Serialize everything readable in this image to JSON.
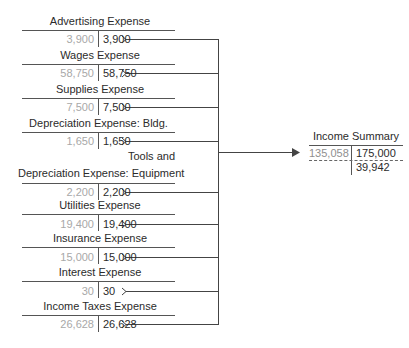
{
  "accounts": [
    {
      "title": "Advertising Expense",
      "debit": "3,900",
      "credit": "3,900"
    },
    {
      "title": "Wages Expense",
      "debit": "58,750",
      "credit": "58,750"
    },
    {
      "title": "Supplies Expense",
      "debit": "7,500",
      "credit": "7,500"
    },
    {
      "title": "Depreciation Expense: Bldg.",
      "debit": "1,650",
      "credit": "1,650"
    },
    {
      "title_line1": "Tools and",
      "title": "Depreciation Expense: Equipment",
      "debit": "2,200",
      "credit": "2,200"
    },
    {
      "title": "Utilities Expense",
      "debit": "19,400",
      "credit": "19,400"
    },
    {
      "title": "Insurance Expense",
      "debit": "15,000",
      "credit": "15,000"
    },
    {
      "title": "Interest Expense",
      "debit": "30",
      "credit": "30"
    },
    {
      "title": "Income Taxes Expense",
      "debit": "26,628",
      "credit": "26,628"
    }
  ],
  "income_summary": {
    "title": "Income Summary",
    "debit": "135,058",
    "credit": "175,000",
    "balance": "39,942"
  },
  "colors": {
    "line": "#444444",
    "debit_text": "#a8a8a8",
    "text": "#2b2b2b"
  }
}
